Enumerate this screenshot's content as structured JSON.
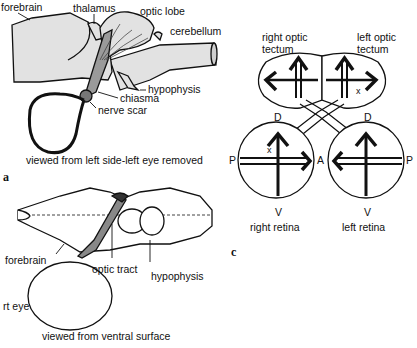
{
  "figure": {
    "panel_a": {
      "letter": "a",
      "caption": "viewed from left side-left eye removed",
      "labels": {
        "forebrain": "forebrain",
        "thalamus": "thalamus",
        "optic_lobe": "optic lobe",
        "cerebellum": "cerebellum",
        "hypophysis": "hypophysis",
        "chiasma": "chiasma",
        "nerve_scar": "nerve scar"
      }
    },
    "panel_b": {
      "caption": "viewed from ventral surface",
      "labels": {
        "forebrain": "forebrain",
        "optic_tract": "optic tract",
        "hypophysis": "hypophysis",
        "rt_eye": "rt eye"
      }
    },
    "panel_c": {
      "letter": "c",
      "labels": {
        "right_tectum_1": "right optic",
        "right_tectum_2": "tectum",
        "left_tectum_1": "left optic",
        "left_tectum_2": "tectum",
        "right_retina": "right retina",
        "left_retina": "left retina"
      },
      "axes": {
        "dorsal": "D",
        "ventral": "V",
        "posterior": "P",
        "anterior": "A",
        "marker": "x"
      }
    },
    "colors": {
      "ink": "#111111",
      "brain_fill": "#e2e2e2",
      "background": "#ffffff"
    }
  }
}
